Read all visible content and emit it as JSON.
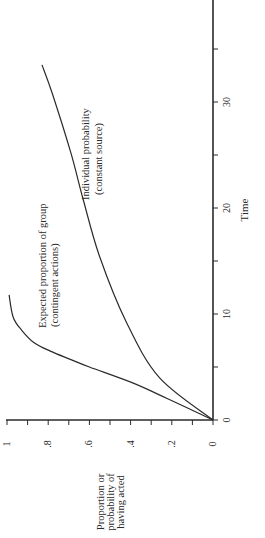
{
  "chart_data": {
    "type": "line",
    "orientation_note": "figure printed rotated 90 degrees counter-clockwise",
    "title": "",
    "xlabel": "Time",
    "ylabel": "Proportion or probability of having acted",
    "ylabel_lines": [
      "Proportion or",
      "probability of",
      "having acted"
    ],
    "xlim": [
      0,
      40
    ],
    "ylim": [
      0,
      1
    ],
    "x_ticks": [
      0,
      5,
      10,
      15,
      20,
      25,
      30,
      35,
      40
    ],
    "x_tick_labels": [
      {
        "value": 0,
        "label": "0"
      },
      {
        "value": 10,
        "label": "10"
      },
      {
        "value": 20,
        "label": "20"
      },
      {
        "value": 30,
        "label": "30"
      },
      {
        "value": 40,
        "label": "4"
      }
    ],
    "y_ticks": [
      0,
      0.1,
      0.2,
      0.3,
      0.4,
      0.5,
      0.6,
      0.7,
      0.8,
      0.9,
      1.0
    ],
    "y_tick_labels": [
      {
        "value": 0,
        "label": "0"
      },
      {
        "value": 0.2,
        "label": ".2"
      },
      {
        "value": 0.4,
        "label": ".4"
      },
      {
        "value": 0.6,
        "label": ".6"
      },
      {
        "value": 0.8,
        "label": ".8"
      },
      {
        "value": 1.0,
        "label": "1"
      }
    ],
    "grid": false,
    "legend": "none (inline curve annotations)",
    "series": [
      {
        "name": "Expected proportion of group (contingent actions)",
        "annotation_lines": [
          "Expected proportion of group",
          "(contingent actions)"
        ],
        "x": [
          0,
          2,
          3.5,
          5,
          5.7,
          6.5,
          7.3,
          8.5,
          9.7,
          11.8
        ],
        "y": [
          0,
          0.22,
          0.39,
          0.6,
          0.69,
          0.79,
          0.87,
          0.93,
          0.97,
          0.99
        ]
      },
      {
        "name": "Individual probability (constant source)",
        "annotation_lines": [
          "Individual probability",
          "(constant source)"
        ],
        "x": [
          0,
          4,
          9.2,
          15.4,
          20.8,
          25.2,
          30.8,
          33.5
        ],
        "y": [
          0,
          0.26,
          0.42,
          0.55,
          0.63,
          0.69,
          0.78,
          0.83
        ]
      }
    ]
  },
  "colors": {
    "ink": "#2a2a2a",
    "background": "#ffffff"
  }
}
